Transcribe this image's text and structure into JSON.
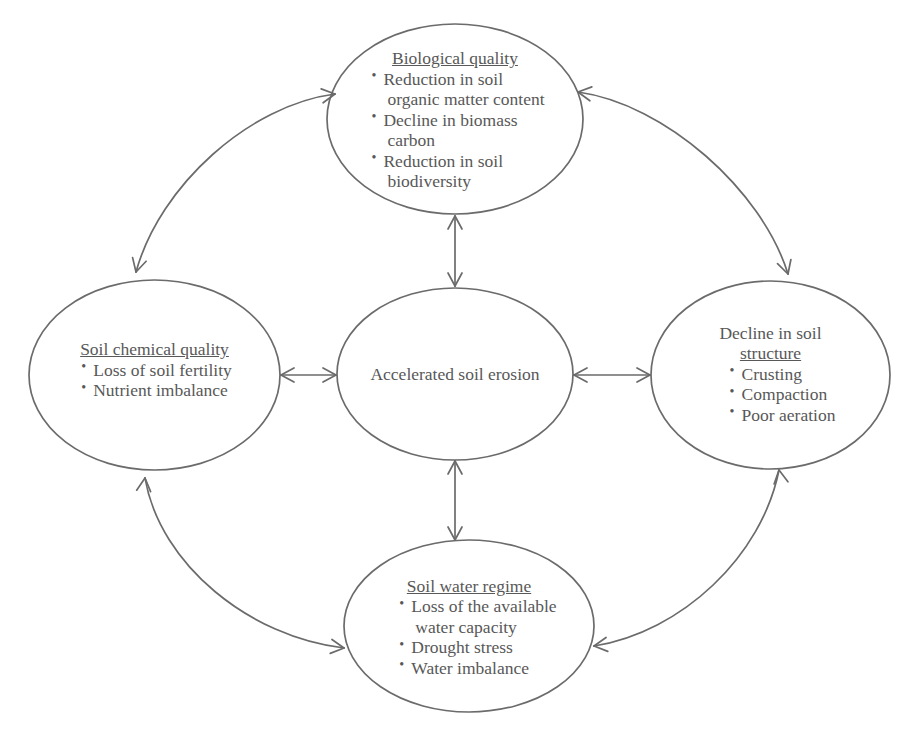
{
  "diagram": {
    "stroke_color": "#6b6b6b",
    "text_color": "#585858",
    "background_color": "#ffffff"
  },
  "nodes": {
    "center": {
      "name": "accelerated-soil-erosion",
      "text": "Accelerated soil erosion"
    },
    "top": {
      "name": "biological-quality",
      "title": "Biological quality",
      "bullets": [
        {
          "line1": "Reduction in soil",
          "line2": "organic matter content"
        },
        {
          "line1": "Decline in biomass",
          "line2": "carbon"
        },
        {
          "line1": "Reduction in soil",
          "line2": "biodiversity"
        }
      ]
    },
    "left": {
      "name": "soil-chemical-quality",
      "title": "Soil chemical quality",
      "bullets": [
        {
          "line1": "Loss of soil fertility",
          "line2": ""
        },
        {
          "line1": "Nutrient imbalance",
          "line2": ""
        }
      ]
    },
    "right": {
      "name": "decline-in-soil-structure",
      "title_line1": "Decline in soil",
      "title_line2": "structure",
      "bullets": [
        {
          "line1": "Crusting",
          "line2": ""
        },
        {
          "line1": "Compaction",
          "line2": ""
        },
        {
          "line1": "Poor aeration",
          "line2": ""
        }
      ]
    },
    "bottom": {
      "name": "soil-water-regime",
      "title": "Soil water regime",
      "bullets": [
        {
          "line1": "Loss of the available",
          "line2": "water capacity"
        },
        {
          "line1": "Drought stress",
          "line2": ""
        },
        {
          "line1": "Water imbalance",
          "line2": ""
        }
      ]
    }
  },
  "connectors": [
    {
      "name": "center-to-top",
      "style": "straight",
      "heads": "both"
    },
    {
      "name": "center-to-bottom",
      "style": "straight",
      "heads": "both"
    },
    {
      "name": "center-to-left",
      "style": "straight",
      "heads": "both"
    },
    {
      "name": "center-to-right",
      "style": "straight",
      "heads": "both"
    },
    {
      "name": "top-to-left-arc",
      "style": "curved",
      "heads": "both"
    },
    {
      "name": "top-to-right-arc",
      "style": "curved",
      "heads": "both"
    },
    {
      "name": "left-to-bottom-arc",
      "style": "curved",
      "heads": "both"
    },
    {
      "name": "right-to-bottom-arc",
      "style": "curved",
      "heads": "both"
    }
  ]
}
